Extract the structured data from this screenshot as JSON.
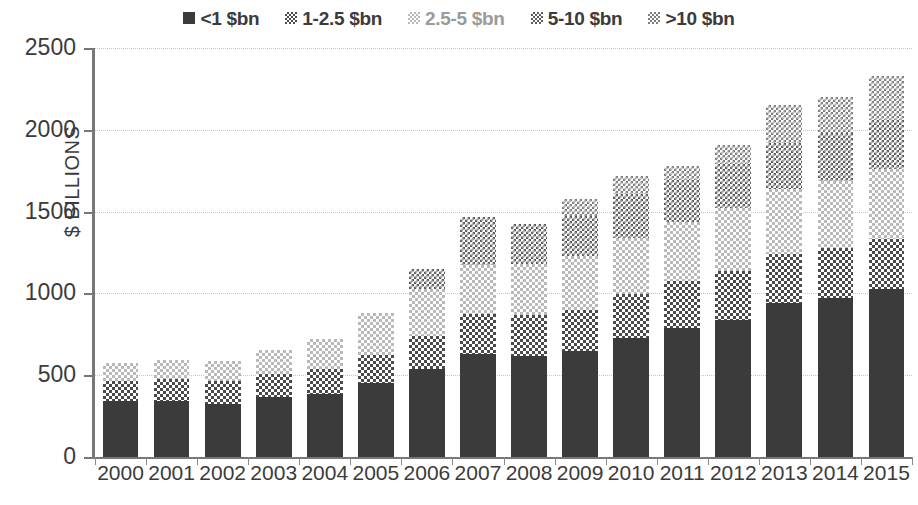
{
  "chart_data": {
    "type": "bar",
    "stacked": true,
    "title": "",
    "xlabel": "",
    "ylabel": "$ BILLIONS",
    "ylim": [
      0,
      2500
    ],
    "ytick_step": 500,
    "yticks": [
      "0",
      "500",
      "1000",
      "1500",
      "2000",
      "2500"
    ],
    "grid": true,
    "legend_position": "top-center",
    "categories": [
      "2000",
      "2001",
      "2002",
      "2003",
      "2004",
      "2005",
      "2006",
      "2007",
      "2008",
      "2009",
      "2010",
      "2011",
      "2012",
      "2013",
      "2014",
      "2015"
    ],
    "series": [
      {
        "name": "<1 $bn",
        "pattern": "solid-dark",
        "color": "#3b3b3b",
        "values": [
          345,
          340,
          325,
          365,
          385,
          455,
          540,
          630,
          615,
          645,
          725,
          790,
          840,
          940,
          975,
          1030
        ]
      },
      {
        "name": "1-2.5 $bn",
        "pattern": "checker-dark",
        "color": "#4a4a4a",
        "values": [
          120,
          135,
          140,
          145,
          155,
          170,
          200,
          245,
          255,
          255,
          270,
          285,
          295,
          300,
          300,
          300
        ]
      },
      {
        "name": "2.5-5 $bn",
        "pattern": "checker-light",
        "color": "#b9b9b9",
        "values": [
          110,
          115,
          125,
          145,
          180,
          255,
          285,
          300,
          310,
          330,
          345,
          360,
          385,
          400,
          415,
          430
        ]
      },
      {
        "name": "5-10 $bn",
        "pattern": "checker-mid-dark",
        "color": "#5d5d5d",
        "values": [
          0,
          0,
          0,
          0,
          0,
          0,
          125,
          295,
          245,
          245,
          265,
          260,
          270,
          280,
          290,
          300
        ]
      },
      {
        "name": ">10 $bn",
        "pattern": "checker-mid",
        "color": "#7e7e7e",
        "values": [
          0,
          0,
          0,
          0,
          0,
          0,
          0,
          0,
          0,
          100,
          115,
          85,
          120,
          230,
          220,
          270
        ]
      }
    ],
    "totals": [
      575,
      590,
      590,
      655,
      720,
      880,
      1150,
      1470,
      1425,
      1575,
      1720,
      1780,
      1910,
      2150,
      2200,
      2330
    ]
  },
  "legend": {
    "items": [
      {
        "label": "<1 $bn",
        "swatch": "p-lt1"
      },
      {
        "label": "1-2.5 $bn",
        "swatch": "p-1_25"
      },
      {
        "label": "2.5-5 $bn",
        "swatch": "p-25_5"
      },
      {
        "label": "5-10 $bn",
        "swatch": "p-5_10"
      },
      {
        "label": ">10 $bn",
        "swatch": "p-gt10"
      }
    ]
  },
  "axis": {
    "y_title": "$ BILLIONS"
  }
}
